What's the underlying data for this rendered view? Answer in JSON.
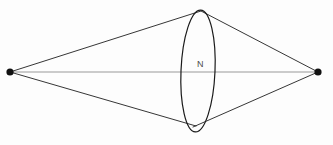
{
  "figure": {
    "background_color": "#fdfdfd",
    "title": "",
    "labels": [
      {
        "name": "N",
        "text": "N",
        "x": 197,
        "y": 67,
        "color": "#4a4a4a",
        "font_size": 9
      }
    ],
    "points": [
      {
        "name": "left-vertex",
        "x": 10,
        "y": 72,
        "radius": 3.6,
        "color": "#111111"
      },
      {
        "name": "right-vertex",
        "x": 318,
        "y": 72,
        "radius": 3.6,
        "color": "#111111"
      }
    ],
    "axis_line": {
      "name": "horizontal-axis",
      "x1": 10,
      "y1": 72,
      "x2": 318,
      "y2": 72,
      "color": "#9a9a9a",
      "width": 1.1
    },
    "edges": [
      {
        "name": "upper-left-edge",
        "x1": 10,
        "y1": 72,
        "x2": 201,
        "y2": 11,
        "color": "#1f1f1f",
        "width": 0.9
      },
      {
        "name": "upper-right-edge",
        "x1": 201,
        "y1": 11,
        "x2": 318,
        "y2": 72,
        "color": "#1f1f1f",
        "width": 0.9
      },
      {
        "name": "lower-left-edge",
        "x1": 10,
        "y1": 72,
        "x2": 196,
        "y2": 126,
        "color": "#1f1f1f",
        "width": 0.9
      },
      {
        "name": "lower-right-edge",
        "x1": 193,
        "y1": 127,
        "x2": 318,
        "y2": 72,
        "color": "#1f1f1f",
        "width": 0.9
      }
    ],
    "ellipse": {
      "name": "central-ellipse",
      "cx": 198,
      "cy": 71,
      "rx": 17,
      "ry": 61,
      "rotation_deg": 2.5,
      "color": "#1a1a1a",
      "width": 1.2,
      "fill": "none"
    }
  }
}
